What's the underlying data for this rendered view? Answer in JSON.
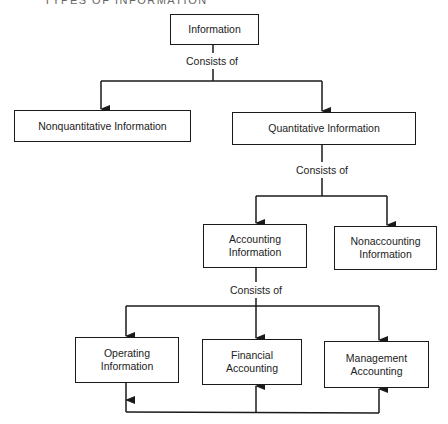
{
  "title": "TYPES OF INFORMATION",
  "nodes": {
    "information": "Information",
    "nonquantitative": "Nonquantitative Information",
    "quantitative": "Quantitative Information",
    "accounting_l1": "Accounting",
    "accounting_l2": "Information",
    "nonaccounting_l1": "Nonaccounting",
    "nonaccounting_l2": "Information",
    "operating_l1": "Operating",
    "operating_l2": "Information",
    "financial_l1": "Financial",
    "financial_l2": "Accounting",
    "management_l1": "Management",
    "management_l2": "Accounting"
  },
  "edges": {
    "consists_1": "Consists of",
    "consists_2": "Consists of",
    "consists_3": "Consists of"
  }
}
